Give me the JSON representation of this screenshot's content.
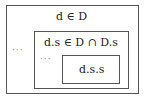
{
  "diagram": {
    "outer": {
      "label": "d ∈ D",
      "ellipsis": "···"
    },
    "middle": {
      "label": "d.s ∈ D ∩ D.s",
      "ellipsis": "···"
    },
    "inner": {
      "label": "d.s.s"
    }
  }
}
